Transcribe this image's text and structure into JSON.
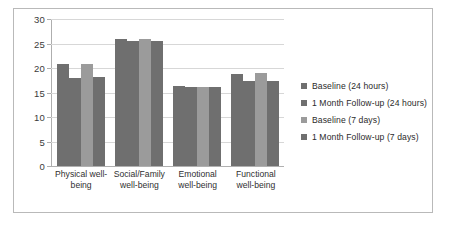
{
  "chart_data": {
    "type": "bar",
    "title": "",
    "subtitle": "",
    "xlabel": "",
    "ylabel": "",
    "ylim": [
      0,
      30
    ],
    "yticks": [
      0,
      5,
      10,
      15,
      20,
      25,
      30
    ],
    "ytick_labels": [
      "0",
      "5",
      "10",
      "15",
      "20",
      "25",
      "30"
    ],
    "grid": true,
    "legend_position": "right",
    "categories": [
      "Physical well-being",
      "Social/Family well-being",
      "Emotional well-being",
      "Functional well-being"
    ],
    "category_lines": [
      [
        "Physical well-",
        "being"
      ],
      [
        "Social/Family",
        "well-being"
      ],
      [
        "Emotional",
        "well-being"
      ],
      [
        "Functional",
        "well-being"
      ]
    ],
    "series": [
      {
        "name": "Baseline (24 hours)",
        "color": "#6f6f6f",
        "values": [
          20.9,
          26.0,
          16.4,
          18.8
        ]
      },
      {
        "name": "1 Month Follow-up (24 hours)",
        "color": "#6f6f6f",
        "values": [
          17.9,
          25.6,
          16.2,
          17.4
        ]
      },
      {
        "name": "Baseline (7 days)",
        "color": "#9b9b9b",
        "values": [
          20.8,
          25.9,
          16.1,
          18.9
        ]
      },
      {
        "name": "1 Month Follow-up (7 days)",
        "color": "#6f6f6f",
        "values": [
          18.2,
          25.6,
          16.1,
          17.3
        ]
      }
    ]
  },
  "colors": {
    "series_dark": "#6f6f6f",
    "series_light": "#9b9b9b",
    "gridline": "#d7d7d7",
    "axis": "#aeaeae",
    "frame_border": "#b9b9b9",
    "background": "#ffffff",
    "text": "#2f2f2f"
  }
}
